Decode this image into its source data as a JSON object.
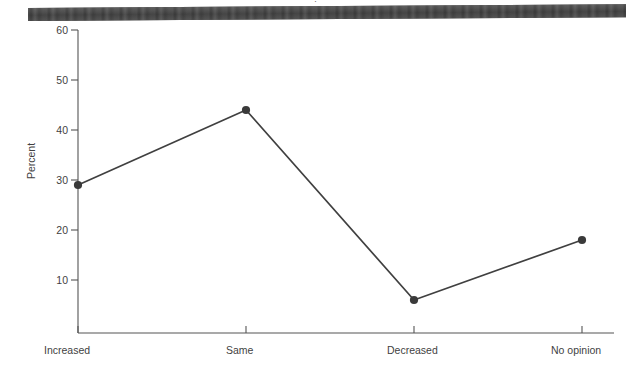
{
  "artifacts": {
    "top_text_fragment": "·",
    "scan_bar_color": "#4a4a4a"
  },
  "chart_data": {
    "type": "line",
    "title": "",
    "xlabel": "",
    "ylabel": "Percent",
    "categories": [
      "Increased",
      "Same",
      "Decreased",
      "No opinion"
    ],
    "values": [
      29,
      44,
      6,
      18
    ],
    "series": [
      {
        "name": "Percent",
        "values": [
          29,
          44,
          6,
          18
        ]
      }
    ],
    "ylim": [
      0,
      60
    ],
    "yticks": [
      10,
      20,
      30,
      40,
      50,
      60
    ],
    "ytick_labels": [
      "10",
      "20",
      "30",
      "40",
      "50",
      "60"
    ],
    "grid": false,
    "legend": false,
    "legend_position": "none",
    "marker": "filled-circle",
    "line_color": "#404040",
    "marker_color": "#3a3a3a",
    "axis_color": "#555555"
  },
  "axes": {
    "y_title": "Percent",
    "y_tick_0": "10",
    "y_tick_1": "20",
    "y_tick_2": "30",
    "y_tick_3": "40",
    "y_tick_4": "50",
    "y_tick_5": "60",
    "x_tick_0": "Increased",
    "x_tick_1": "Same",
    "x_tick_2": "Decreased",
    "x_tick_3": "No opinion"
  }
}
